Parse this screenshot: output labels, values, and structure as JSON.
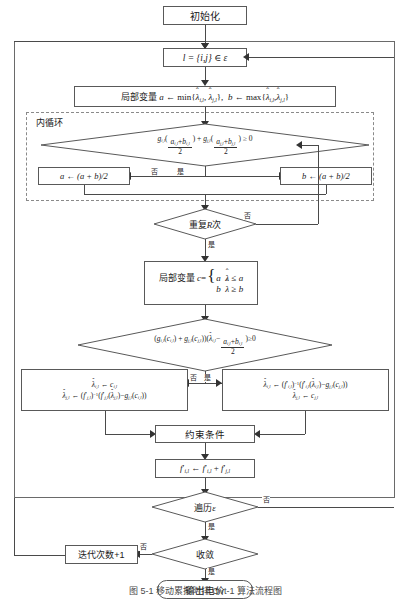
{
  "figure": {
    "caption": "图 5-1  移动累接时排 Ovt-1 算法流程图",
    "inner_loop_label": "内循环"
  },
  "nodes": {
    "start": {
      "name": "初始化",
      "shape": "rect"
    },
    "edge_select": {
      "text": "l = {i, j} ∈ ε",
      "shape": "rect"
    },
    "local_ab": {
      "text": "局部变量 a ← min{λ̂i,l , λ̂j,l},  b ← max{λ̂i,l , λ̂j,l}",
      "shape": "rect"
    },
    "bisect_test": {
      "text": "g i,l ((a i,l + b i,l)/2) + g j,l ((a j,l + b j,l)/2) ≥ 0",
      "shape": "diamond"
    },
    "update_a": {
      "text": "a ← (a + b)/2",
      "shape": "rect"
    },
    "update_b": {
      "text": "b ← (a + b)/2",
      "shape": "rect"
    },
    "repeat_r": {
      "text": "重复R次",
      "shape": "diamond"
    },
    "local_c": {
      "text": "局部变量 c = { a  λ̂ ≤ a ; b  λ̂ ≥ b }",
      "shape": "rect"
    },
    "sign_test": {
      "text": "( g i,l (c i,l) + g j,l (c j,l) )( λ̂ i,l − (a i,l + b i,l)/2 ) ≥ 0",
      "shape": "diamond"
    },
    "assign_left": {
      "line1": "λ̂ i,l ← c i,l",
      "line2": "λ̂ j,l ← ( f′ j,l )⁻¹( f′ j,l ( λ̂ j,l ) − g j,l ( c i,l ) )",
      "shape": "rect"
    },
    "assign_right": {
      "line1": "λ̂ i,l ← ( f′ i,l )⁻¹( f′ i,l ( λ̂ i,l ) − g j,l ( c j,l ) )",
      "line2": "λ̂ j,l ← c j,l",
      "shape": "rect"
    },
    "constraints": {
      "text": "约束条件",
      "shape": "rect"
    },
    "flow_sum": {
      "text": "f′ i,l ← f′ i,l + f′ j,l",
      "shape": "rect"
    },
    "traverse": {
      "text": "遍历ε",
      "shape": "diamond"
    },
    "converge": {
      "text": "收敛",
      "shape": "diamond"
    },
    "iter_inc": {
      "text": "迭代次数+1",
      "shape": "rect"
    },
    "output": {
      "text": "输出电价",
      "shape": "terminator"
    }
  },
  "edge_labels": {
    "no": "否",
    "yes": "是",
    "bisect_no": "否",
    "bisect_yes": "是",
    "repeat_no": "否",
    "repeat_yes": "是",
    "sign_no": "否",
    "sign_yes": "是",
    "traverse_no": "否",
    "traverse_yes": "是",
    "converge_no": "否",
    "converge_yes": "是"
  },
  "colors": {
    "stroke": "#595959",
    "frame": "#6a6a6a",
    "dashed": "#8a8a8a",
    "text": "#1a1a1a",
    "background": "#ffffff"
  }
}
